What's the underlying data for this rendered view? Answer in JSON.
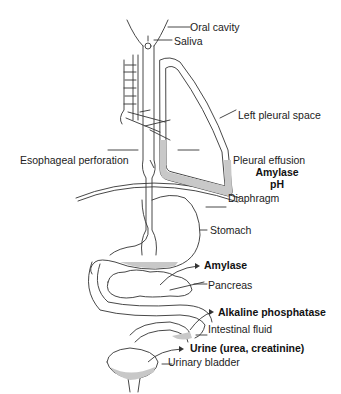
{
  "diagram": {
    "labels": {
      "oral_cavity": "Oral cavity",
      "saliva": "Saliva",
      "left_pleural_space": "Left pleural space",
      "esophageal_perforation": "Esophageal perforation",
      "pleural_effusion": "Pleural effusion",
      "pleural_amylase": "Amylase",
      "pleural_ph": "pH",
      "diaphragm": "Diaphragm",
      "stomach": "Stomach",
      "pancreas_marker": "Amylase",
      "pancreas": "Pancreas",
      "intestinal_marker": "Alkaline phosphatase",
      "intestinal_fluid": "Intestinal fluid",
      "urine_marker": "Urine (urea, creatinine)",
      "urinary_bladder": "Urinary bladder"
    },
    "colors": {
      "line": "#333333",
      "fluid_fill": "#c8c8c8",
      "background": "#ffffff"
    }
  }
}
